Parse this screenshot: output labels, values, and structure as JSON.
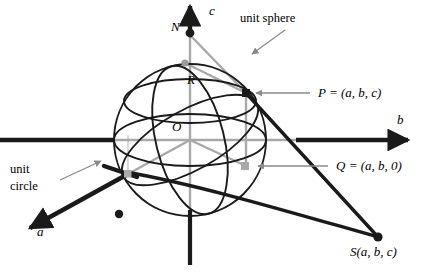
{
  "figure": {
    "background_color": "#ffffff",
    "width": 426,
    "height": 272
  },
  "colors": {
    "stroke_black": "#1a1a1a",
    "stroke_gray": "#a8a8a8",
    "leader_gray": "#808080",
    "text": "#000000"
  },
  "axes": {
    "c": {
      "label": "c",
      "direction": "up",
      "origin": [
        190,
        140
      ]
    },
    "b": {
      "label": "b",
      "direction": "right"
    },
    "a": {
      "label": "a",
      "direction": "down-left"
    }
  },
  "points": {
    "N": {
      "label": "N",
      "coords_text": "",
      "marker": "black-dot"
    },
    "O": {
      "label": "O",
      "marker": "origin"
    },
    "R": {
      "label": "R",
      "marker": "gray-dot"
    },
    "P": {
      "label": "P = (a, b, c)",
      "name": "P",
      "marker": "black-square"
    },
    "Q": {
      "label": "Q =  (a, b, 0)",
      "name": "Q",
      "marker": "gray-square"
    },
    "S": {
      "label": "S(a, b, c)",
      "name": "S",
      "marker": "black-dot"
    }
  },
  "annotations": {
    "unit_sphere": "unit sphere",
    "unit_circle_line1": "unit",
    "unit_circle_line2": "circle"
  }
}
